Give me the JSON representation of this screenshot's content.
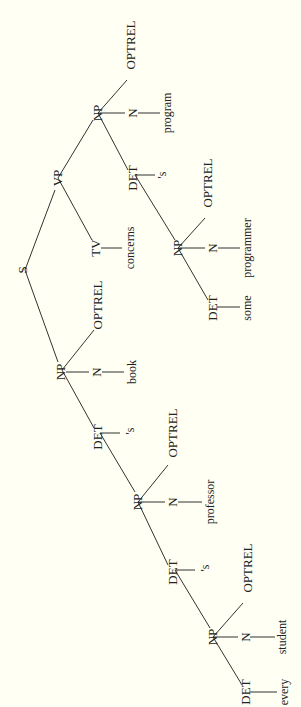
{
  "diagram": {
    "type": "parse-tree",
    "orientation": "rotated-90-ccw",
    "background": "#fffff3",
    "sentence": "every student 's professor 's book concerns some programmer 's program",
    "nodes": [
      {
        "id": "S",
        "label": "S",
        "x": 22,
        "y": 270,
        "kind": "cat"
      },
      {
        "id": "NP1",
        "label": "NP",
        "x": 60,
        "y": 372,
        "kind": "cat"
      },
      {
        "id": "VP",
        "label": "VP",
        "x": 57,
        "y": 178,
        "kind": "cat"
      },
      {
        "id": "DET1",
        "label": "DET",
        "x": 97,
        "y": 437,
        "kind": "cat"
      },
      {
        "id": "N1",
        "label": "N",
        "x": 96,
        "y": 372,
        "kind": "cat"
      },
      {
        "id": "OPT1",
        "label": "OPTREL",
        "x": 97,
        "y": 305,
        "kind": "cat"
      },
      {
        "id": "book",
        "label": "book",
        "x": 132,
        "y": 372,
        "kind": "word"
      },
      {
        "id": "poss1",
        "label": "'s",
        "x": 130,
        "y": 431,
        "kind": "word"
      },
      {
        "id": "NP2",
        "label": "NP",
        "x": 137,
        "y": 502,
        "kind": "cat"
      },
      {
        "id": "DET2",
        "label": "DET",
        "x": 172,
        "y": 572,
        "kind": "cat"
      },
      {
        "id": "N2",
        "label": "N",
        "x": 172,
        "y": 502,
        "kind": "cat"
      },
      {
        "id": "OPT2",
        "label": "OPTREL",
        "x": 172,
        "y": 433,
        "kind": "cat"
      },
      {
        "id": "professor",
        "label": "professor",
        "x": 210,
        "y": 502,
        "kind": "word"
      },
      {
        "id": "poss2",
        "label": "'s",
        "x": 205,
        "y": 568,
        "kind": "word"
      },
      {
        "id": "NP3",
        "label": "NP",
        "x": 212,
        "y": 637,
        "kind": "cat"
      },
      {
        "id": "DET3",
        "label": "DET",
        "x": 245,
        "y": 692,
        "kind": "cat"
      },
      {
        "id": "N3",
        "label": "N",
        "x": 245,
        "y": 637,
        "kind": "cat"
      },
      {
        "id": "OPT3",
        "label": "OPTREL",
        "x": 247,
        "y": 568,
        "kind": "cat"
      },
      {
        "id": "every",
        "label": "every",
        "x": 284,
        "y": 692,
        "kind": "word"
      },
      {
        "id": "student",
        "label": "student",
        "x": 282,
        "y": 637,
        "kind": "word"
      },
      {
        "id": "TV",
        "label": "TV",
        "x": 95,
        "y": 248,
        "kind": "cat"
      },
      {
        "id": "concerns",
        "label": "concerns",
        "x": 130,
        "y": 248,
        "kind": "word"
      },
      {
        "id": "NP4",
        "label": "NP",
        "x": 97,
        "y": 113,
        "kind": "cat"
      },
      {
        "id": "DET4",
        "label": "DET",
        "x": 132,
        "y": 178,
        "kind": "cat"
      },
      {
        "id": "N4",
        "label": "N",
        "x": 132,
        "y": 113,
        "kind": "cat"
      },
      {
        "id": "OPT4",
        "label": "OPTREL",
        "x": 130,
        "y": 45,
        "kind": "cat"
      },
      {
        "id": "program",
        "label": "program",
        "x": 167,
        "y": 113,
        "kind": "word"
      },
      {
        "id": "poss4",
        "label": "'s",
        "x": 162,
        "y": 175,
        "kind": "word"
      },
      {
        "id": "NP5",
        "label": "NP",
        "x": 177,
        "y": 248,
        "kind": "cat"
      },
      {
        "id": "DET5",
        "label": "DET",
        "x": 212,
        "y": 308,
        "kind": "cat"
      },
      {
        "id": "N5",
        "label": "N",
        "x": 212,
        "y": 248,
        "kind": "cat"
      },
      {
        "id": "OPT5",
        "label": "OPTREL",
        "x": 207,
        "y": 183,
        "kind": "cat"
      },
      {
        "id": "some",
        "label": "some",
        "x": 247,
        "y": 308,
        "kind": "word"
      },
      {
        "id": "programmer",
        "label": "programmer",
        "x": 247,
        "y": 248,
        "kind": "word"
      }
    ],
    "edges": [
      [
        25,
        270,
        58,
        362
      ],
      [
        25,
        270,
        55,
        190
      ],
      [
        62,
        370,
        94,
        428
      ],
      [
        66,
        372,
        89,
        372
      ],
      [
        62,
        370,
        94,
        330
      ],
      [
        102,
        372,
        124,
        372
      ],
      [
        100,
        433,
        120,
        433
      ],
      [
        100,
        433,
        135,
        492
      ],
      [
        138,
        502,
        165,
        502
      ],
      [
        138,
        502,
        168,
        465
      ],
      [
        178,
        502,
        202,
        502
      ],
      [
        138,
        502,
        168,
        565
      ],
      [
        175,
        570,
        195,
        570
      ],
      [
        175,
        570,
        210,
        628
      ],
      [
        213,
        637,
        238,
        637
      ],
      [
        213,
        637,
        243,
        603
      ],
      [
        250,
        637,
        275,
        637
      ],
      [
        213,
        637,
        242,
        685
      ],
      [
        250,
        692,
        277,
        692
      ],
      [
        58,
        178,
        92,
        240
      ],
      [
        101,
        248,
        122,
        248
      ],
      [
        58,
        178,
        93,
        120
      ],
      [
        98,
        113,
        125,
        113
      ],
      [
        98,
        113,
        127,
        80
      ],
      [
        138,
        113,
        160,
        113
      ],
      [
        98,
        113,
        128,
        170
      ],
      [
        135,
        175,
        155,
        175
      ],
      [
        135,
        175,
        175,
        240
      ],
      [
        178,
        248,
        205,
        248
      ],
      [
        178,
        248,
        205,
        218
      ],
      [
        218,
        248,
        240,
        248
      ],
      [
        178,
        248,
        208,
        300
      ],
      [
        217,
        307,
        240,
        307
      ]
    ]
  }
}
